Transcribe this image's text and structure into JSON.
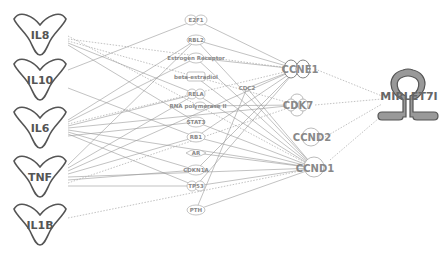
{
  "diagram": {
    "type": "pathway-network",
    "left_nodes": [
      {
        "id": "IL8",
        "label": "IL8",
        "shape": "cytokine",
        "x": 40,
        "y": 35
      },
      {
        "id": "IL10",
        "label": "IL10",
        "shape": "cytokine",
        "x": 40,
        "y": 80
      },
      {
        "id": "IL6",
        "label": "IL6",
        "shape": "cytokine",
        "x": 40,
        "y": 128
      },
      {
        "id": "TNF",
        "label": "TNF",
        "shape": "cytokine",
        "x": 40,
        "y": 177
      },
      {
        "id": "IL1B",
        "label": "IL1B",
        "shape": "cytokine",
        "x": 40,
        "y": 225
      }
    ],
    "middle_nodes": [
      {
        "id": "E2F1",
        "label": "E2F1",
        "x": 196,
        "y": 20
      },
      {
        "id": "RBL2",
        "label": "RBL2",
        "x": 196,
        "y": 40
      },
      {
        "id": "ER",
        "label": "Estrogen Receptor",
        "x": 196,
        "y": 58
      },
      {
        "id": "BE",
        "label": "beta-estradiol",
        "x": 196,
        "y": 77
      },
      {
        "id": "RELA",
        "label": "RELA",
        "x": 196,
        "y": 94
      },
      {
        "id": "RNAP2",
        "label": "RNA polymerase II",
        "x": 196,
        "y": 106
      },
      {
        "id": "STAT3",
        "label": "STAT3",
        "x": 196,
        "y": 122
      },
      {
        "id": "RB1",
        "label": "RB1",
        "x": 196,
        "y": 137
      },
      {
        "id": "AR",
        "label": "AR",
        "x": 196,
        "y": 153
      },
      {
        "id": "CDKN1A",
        "label": "CDKN1A",
        "x": 196,
        "y": 170
      },
      {
        "id": "TP53",
        "label": "TP53",
        "x": 196,
        "y": 186
      },
      {
        "id": "PTH",
        "label": "PTH",
        "x": 196,
        "y": 210
      }
    ],
    "cdc": {
      "id": "CDC2",
      "label": "CDC2",
      "x": 247,
      "y": 88
    },
    "right_nodes": [
      {
        "id": "CCNE1",
        "label": "CCNE1",
        "x": 297,
        "y": 69
      },
      {
        "id": "CDK7",
        "label": "CDK7",
        "x": 297,
        "y": 105
      },
      {
        "id": "CCND2",
        "label": "CCND2",
        "x": 310,
        "y": 137
      },
      {
        "id": "CCND1",
        "label": "CCND1",
        "x": 315,
        "y": 168
      }
    ],
    "target": {
      "id": "MIRLET7I",
      "label": "MIRLET7I",
      "x": 408,
      "y": 96
    }
  }
}
